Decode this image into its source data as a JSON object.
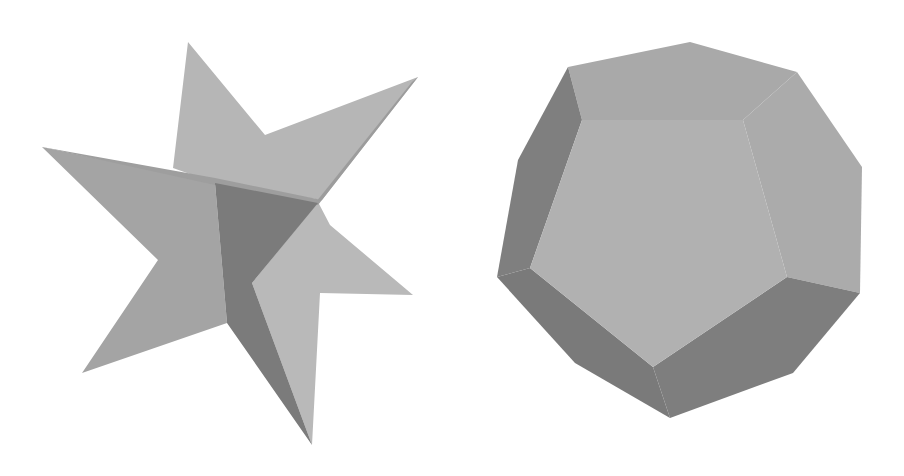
{
  "figure": {
    "panels": [
      {
        "id": "left",
        "subject": "stellated star polyhedron (six-pointed, grey shaded)",
        "colors": {
          "top_sheet": "#b6b6b6",
          "left_sheet": "#a4a4a4",
          "right_sheet": "#b9b9b9",
          "dark_face": "#7b7b7b",
          "edge_strip": "#9a9a9a"
        }
      },
      {
        "id": "right",
        "subject": "dodecahedron (grey shaded)",
        "colors": {
          "front_face": "#b1b1b1",
          "top_face": "#a9a9a9",
          "right_face": "#ababab",
          "left_face": "#7f7f7f",
          "bottom_left_face": "#7a7a7a",
          "bottom_right_face": "#7e7e7e"
        }
      }
    ],
    "background": "#ffffff"
  }
}
